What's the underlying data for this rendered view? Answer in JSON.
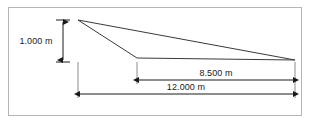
{
  "diagram": {
    "units": "m",
    "border": {
      "name": "outer-frame",
      "color": "#b5b5b5",
      "x": 8.5,
      "y": 7.5,
      "width": 293,
      "height": 108
    },
    "colors": {
      "line": "#3a3a3a",
      "dimension": "#1a1a1a",
      "text": "#1a1a1a",
      "frame": "#b5b5b5",
      "background": "#ffffff"
    },
    "geometry": {
      "apex": {
        "name": "apex-vertex",
        "x": 78,
        "y": 20
      },
      "knee": {
        "name": "knee-vertex",
        "x": 137,
        "y": 58
      },
      "right": {
        "name": "right-vertex",
        "x": 295,
        "y": 60
      },
      "upper_chord": {
        "name": "upper-chord",
        "x1": 78,
        "y1": 20,
        "x2": 295,
        "y2": 60
      },
      "lower_chord": {
        "name": "lower-chord",
        "x1": 78,
        "y1": 20,
        "x2": 137,
        "y2": 58
      },
      "baseline": {
        "name": "baseline",
        "x1": 137,
        "y1": 58,
        "x2": 295,
        "y2": 60
      }
    },
    "dimensions": [
      {
        "name": "height-dimension",
        "label": "1.000 m",
        "value": 1.0,
        "orientation": "vertical",
        "axis_x": 63,
        "y_start": 20,
        "y_end": 62,
        "tick_half_width": 7,
        "label_x": 36,
        "label_y": 44,
        "label_anchor": "middle"
      },
      {
        "name": "run-dimension",
        "label": "8.500 m",
        "value": 8.5,
        "orientation": "horizontal",
        "axis_y": 80,
        "x_start": 137,
        "x_end": 295,
        "label_x": 216,
        "label_y": 76,
        "label_anchor": "middle"
      },
      {
        "name": "span-dimension",
        "label": "12.000 m",
        "value": 12.0,
        "orientation": "horizontal",
        "axis_y": 94,
        "x_start": 78,
        "x_end": 295,
        "label_x": 186,
        "label_y": 90,
        "label_anchor": "middle"
      }
    ],
    "extension_lines": [
      {
        "name": "extension-left-apex",
        "x1": 78,
        "y1": 62,
        "x2": 78,
        "y2": 98
      },
      {
        "name": "extension-knee",
        "x1": 137,
        "y1": 62,
        "x2": 137,
        "y2": 84
      },
      {
        "name": "extension-right",
        "x1": 295,
        "y1": 62,
        "x2": 295,
        "y2": 98
      }
    ]
  }
}
